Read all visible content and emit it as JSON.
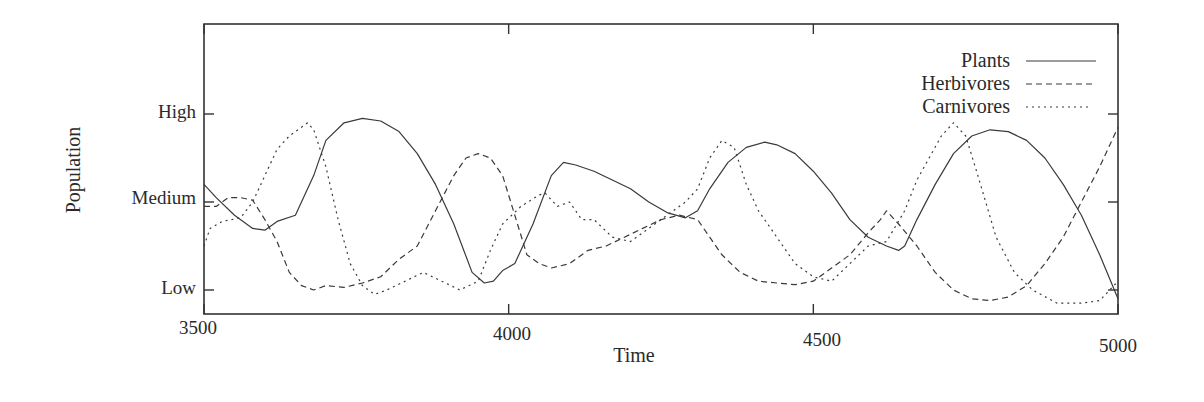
{
  "chart_data": {
    "type": "line",
    "title": "",
    "xlabel": "Time",
    "ylabel": "Population",
    "xlim": [
      3500,
      5000
    ],
    "ylim": [
      -0.3,
      3.0
    ],
    "grid": false,
    "legend_position": "top-right (inside)",
    "x_ticks": [
      3500,
      4000,
      4500,
      5000
    ],
    "x_tick_labels": [
      "3500",
      "4000",
      "4500",
      "5000"
    ],
    "y_ticks": [
      0,
      1,
      2
    ],
    "y_tick_labels": [
      "Low",
      "Medium",
      "High"
    ],
    "series": [
      {
        "name": "Plants",
        "style": "solid",
        "x": [
          3500,
          3520,
          3550,
          3580,
          3600,
          3620,
          3650,
          3680,
          3700,
          3730,
          3760,
          3790,
          3820,
          3850,
          3880,
          3910,
          3940,
          3960,
          3975,
          3990,
          4010,
          4040,
          4070,
          4090,
          4110,
          4140,
          4170,
          4200,
          4230,
          4260,
          4290,
          4310,
          4330,
          4360,
          4390,
          4420,
          4440,
          4470,
          4500,
          4530,
          4560,
          4590,
          4620,
          4640,
          4650,
          4670,
          4700,
          4730,
          4760,
          4790,
          4820,
          4850,
          4880,
          4910,
          4940,
          4970,
          5000
        ],
        "values": [
          1.2,
          1.05,
          0.85,
          0.7,
          0.68,
          0.78,
          0.85,
          1.3,
          1.7,
          1.9,
          1.95,
          1.92,
          1.8,
          1.55,
          1.2,
          0.75,
          0.2,
          0.08,
          0.1,
          0.22,
          0.3,
          0.75,
          1.3,
          1.45,
          1.42,
          1.35,
          1.25,
          1.15,
          1.0,
          0.88,
          0.82,
          0.9,
          1.15,
          1.45,
          1.62,
          1.68,
          1.65,
          1.55,
          1.35,
          1.1,
          0.8,
          0.6,
          0.5,
          0.45,
          0.5,
          0.8,
          1.2,
          1.55,
          1.75,
          1.82,
          1.8,
          1.7,
          1.5,
          1.2,
          0.85,
          0.4,
          -0.1
        ]
      },
      {
        "name": "Herbivores",
        "style": "dashed",
        "x": [
          3500,
          3520,
          3540,
          3560,
          3580,
          3600,
          3620,
          3640,
          3660,
          3680,
          3700,
          3730,
          3760,
          3790,
          3820,
          3850,
          3880,
          3910,
          3930,
          3950,
          3970,
          3990,
          4010,
          4030,
          4050,
          4070,
          4100,
          4130,
          4160,
          4190,
          4220,
          4250,
          4280,
          4310,
          4330,
          4350,
          4380,
          4410,
          4440,
          4470,
          4500,
          4530,
          4560,
          4590,
          4610,
          4620,
          4640,
          4670,
          4700,
          4730,
          4760,
          4790,
          4820,
          4850,
          4880,
          4910,
          4940,
          4970,
          5000
        ],
        "values": [
          0.95,
          0.95,
          1.05,
          1.05,
          1.02,
          0.8,
          0.55,
          0.2,
          0.05,
          0.0,
          0.05,
          0.03,
          0.08,
          0.15,
          0.35,
          0.5,
          0.9,
          1.3,
          1.5,
          1.55,
          1.5,
          1.3,
          0.85,
          0.4,
          0.3,
          0.25,
          0.3,
          0.45,
          0.5,
          0.6,
          0.7,
          0.8,
          0.85,
          0.8,
          0.6,
          0.4,
          0.2,
          0.1,
          0.08,
          0.06,
          0.1,
          0.25,
          0.4,
          0.65,
          0.8,
          0.9,
          0.75,
          0.5,
          0.2,
          0.0,
          -0.1,
          -0.12,
          -0.08,
          0.05,
          0.3,
          0.6,
          1.0,
          1.4,
          1.85
        ]
      },
      {
        "name": "Carnivores",
        "style": "dotted",
        "x": [
          3500,
          3510,
          3530,
          3560,
          3580,
          3600,
          3620,
          3640,
          3660,
          3670,
          3680,
          3700,
          3720,
          3740,
          3760,
          3780,
          3800,
          3830,
          3860,
          3890,
          3920,
          3950,
          3970,
          3990,
          4020,
          4050,
          4060,
          4080,
          4100,
          4120,
          4140,
          4170,
          4200,
          4230,
          4260,
          4290,
          4310,
          4330,
          4350,
          4370,
          4390,
          4410,
          4440,
          4470,
          4500,
          4530,
          4560,
          4590,
          4620,
          4650,
          4670,
          4690,
          4710,
          4730,
          4750,
          4770,
          4800,
          4830,
          4860,
          4900,
          4940,
          4970,
          5000
        ],
        "values": [
          0.5,
          0.7,
          0.78,
          0.82,
          1.0,
          1.3,
          1.6,
          1.75,
          1.85,
          1.9,
          1.82,
          1.4,
          0.8,
          0.3,
          0.05,
          -0.05,
          0.0,
          0.1,
          0.2,
          0.1,
          0.0,
          0.1,
          0.45,
          0.75,
          0.95,
          1.08,
          1.1,
          0.95,
          1.0,
          0.8,
          0.8,
          0.6,
          0.55,
          0.7,
          0.85,
          1.0,
          1.15,
          1.5,
          1.7,
          1.62,
          1.2,
          0.9,
          0.6,
          0.3,
          0.15,
          0.1,
          0.3,
          0.5,
          0.55,
          0.9,
          1.25,
          1.5,
          1.75,
          1.9,
          1.75,
          1.3,
          0.6,
          0.2,
          0.0,
          -0.15,
          -0.15,
          -0.12,
          0.1
        ]
      }
    ]
  },
  "legend": {
    "items": [
      {
        "label": "Plants",
        "style": "solid"
      },
      {
        "label": "Herbivores",
        "style": "dashed"
      },
      {
        "label": "Carnivores",
        "style": "dotted"
      }
    ]
  },
  "axes": {
    "xlabel": "Time",
    "ylabel": "Population",
    "x_tick_labels": [
      "3500",
      "4000",
      "4500",
      "5000"
    ],
    "y_tick_labels": [
      "Low",
      "Medium",
      "High"
    ]
  }
}
